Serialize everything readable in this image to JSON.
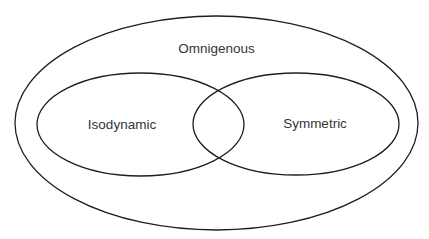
{
  "diagram": {
    "type": "venn",
    "colors": {
      "outline": "#1e1e1e",
      "label": "#353535",
      "background": "#ffffff"
    },
    "sets": [
      {
        "id": "omnigenous",
        "label": "Omnigenous",
        "contains": [
          "isodynamic",
          "symmetric"
        ]
      },
      {
        "id": "isodynamic",
        "label": "Isodynamic",
        "overlaps": [
          "symmetric"
        ]
      },
      {
        "id": "symmetric",
        "label": "Symmetric",
        "overlaps": [
          "isodynamic"
        ]
      }
    ]
  }
}
